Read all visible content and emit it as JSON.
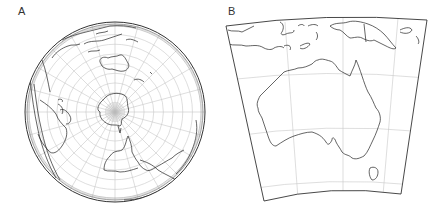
{
  "figure": {
    "panels": [
      {
        "label": "A",
        "description": "Azimuthal (orthographic-style) projection of the globe centred near the South Pole, with Antarctica at centre, Australia above, South America below, Africa at left edge; graticule of meridians and parallels",
        "graticule": {
          "meridians": 24,
          "parallels": 9
        },
        "features": [
          "Antarctica",
          "Australia",
          "New Zealand",
          "South America",
          "Africa",
          "Southeast Asia"
        ]
      },
      {
        "label": "B",
        "description": "Conic projection map of Australia with Tasmania, New Guinea and Indonesian islands; light graticule lines",
        "graticule": {
          "meridians": 3,
          "parallels": 3
        },
        "features": [
          "Australia",
          "Tasmania",
          "New Guinea",
          "Indonesia",
          "Solomon Islands"
        ]
      }
    ]
  },
  "colors": {
    "coastline": "#222222",
    "graticule": "#c8c8c8",
    "frame": "#333333",
    "background": "#ffffff"
  }
}
